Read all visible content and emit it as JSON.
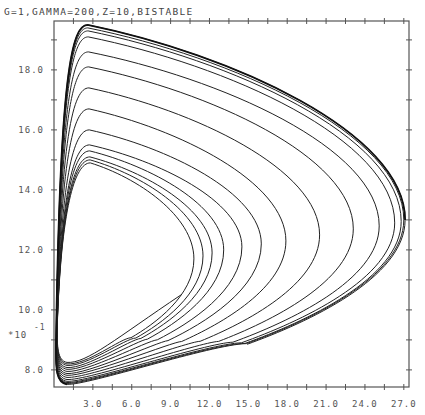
{
  "chart_data": {
    "type": "line",
    "title": "G=1,GAMMA=200,Z=10,BISTABLE",
    "xlabel": "",
    "ylabel": "",
    "y_scale_note": "*10^-1",
    "y_scale_base": "*10",
    "y_scale_exp": "-1",
    "xlim": [
      0,
      27.4
    ],
    "ylim": [
      7.43,
      19.63
    ],
    "x_ticks": [
      3.0,
      6.0,
      9.0,
      12.0,
      15.0,
      18.0,
      21.0,
      24.0,
      27.0
    ],
    "x_tick_labels": [
      "3.0",
      "6.0",
      "9.0",
      "12.0",
      "15.0",
      "18.0",
      "21.0",
      "24.0",
      "27.0"
    ],
    "x_minor_step": 1.5,
    "y_ticks": [
      8.0,
      10.0,
      12.0,
      14.0,
      16.0,
      18.0
    ],
    "y_tick_labels": [
      "8.0",
      "10.0",
      "12.0",
      "14.0",
      "16.0",
      "18.0"
    ],
    "y_minor_step": 1.0,
    "grid": false,
    "legend": null,
    "series": [
      {
        "name": "spiral trajectory (outward to limit cycle)",
        "description": "single phase-plane trajectory spiraling outward; loops listed innermost to outermost",
        "start_point": [
          9.8,
          10.5
        ],
        "loops": [
          {
            "peak_y": 14.9,
            "nose_x": 10.8,
            "nose_y": 11.7,
            "bottom_y": 8.2
          },
          {
            "peak_y": 15.0,
            "nose_x": 11.5,
            "nose_y": 11.8,
            "bottom_y": 8.15
          },
          {
            "peak_y": 15.1,
            "nose_x": 12.2,
            "nose_y": 11.9,
            "bottom_y": 8.1
          },
          {
            "peak_y": 15.3,
            "nose_x": 13.1,
            "nose_y": 12.0,
            "bottom_y": 8.03
          },
          {
            "peak_y": 15.5,
            "nose_x": 14.5,
            "nose_y": 12.1,
            "bottom_y": 7.97
          },
          {
            "peak_y": 16.0,
            "nose_x": 16.0,
            "nose_y": 12.2,
            "bottom_y": 7.9
          },
          {
            "peak_y": 16.7,
            "nose_x": 17.9,
            "nose_y": 12.3,
            "bottom_y": 7.83
          },
          {
            "peak_y": 17.4,
            "nose_x": 20.5,
            "nose_y": 12.5,
            "bottom_y": 7.77
          },
          {
            "peak_y": 18.1,
            "nose_x": 23.1,
            "nose_y": 12.7,
            "bottom_y": 7.7
          },
          {
            "peak_y": 18.6,
            "nose_x": 25.1,
            "nose_y": 12.8,
            "bottom_y": 7.63
          },
          {
            "peak_y": 19.1,
            "nose_x": 26.3,
            "nose_y": 12.9,
            "bottom_y": 7.57
          },
          {
            "peak_y": 19.3,
            "nose_x": 26.8,
            "nose_y": 12.95,
            "bottom_y": 7.53
          },
          {
            "peak_y": 19.4,
            "nose_x": 27.0,
            "nose_y": 13.0,
            "bottom_y": 7.5
          },
          {
            "peak_y": 19.5,
            "nose_x": 27.1,
            "nose_y": 13.0,
            "bottom_y": 7.47
          }
        ]
      }
    ]
  },
  "colors": {
    "background": "#ffffff",
    "axis": "#555555",
    "curve": "#222222",
    "text": "#444444"
  }
}
